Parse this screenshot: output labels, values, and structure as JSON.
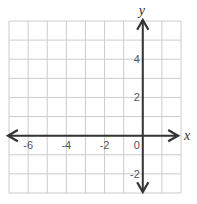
{
  "chart_data": {
    "type": "coordinate_grid",
    "title": "",
    "xlabel": "x",
    "ylabel": "y",
    "xlim": [
      -7,
      2
    ],
    "ylim": [
      -3,
      6
    ],
    "grid": true,
    "grid_step": 1,
    "x_tick_labels": [
      {
        "value": -6,
        "label": "-6"
      },
      {
        "value": -4,
        "label": "-4"
      },
      {
        "value": -2,
        "label": "-2"
      },
      {
        "value": 0,
        "label": "0"
      }
    ],
    "y_tick_labels": [
      {
        "value": 4,
        "label": "4"
      },
      {
        "value": 2,
        "label": "2"
      },
      {
        "value": -2,
        "label": "-2"
      }
    ],
    "arrows": "both axes, both directions",
    "series": [],
    "colors": {
      "grid": "#cccccc",
      "axis": "#333333",
      "tick_text": "#555555"
    }
  }
}
